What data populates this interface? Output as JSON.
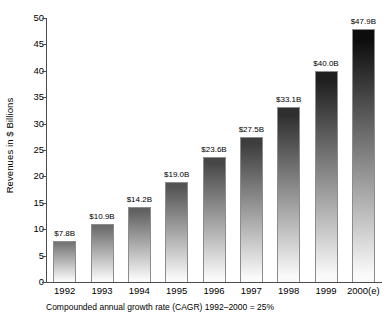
{
  "chart_data": {
    "type": "bar",
    "title": "",
    "xlabel": "",
    "ylabel": "Revenues in $ Billions",
    "categories": [
      "1992",
      "1993",
      "1994",
      "1995",
      "1996",
      "1997",
      "1998",
      "1999",
      "2000(e)"
    ],
    "values": [
      7.8,
      10.9,
      14.2,
      19.0,
      23.6,
      27.5,
      33.1,
      40.0,
      47.9
    ],
    "data_labels": [
      "$7.8B",
      "$10.9B",
      "$14.2B",
      "$19.0B",
      "$23.6B",
      "$27.5B",
      "$33.1B",
      "$40.0B",
      "$47.9B"
    ],
    "ylim": [
      0,
      50
    ],
    "yticks": [
      0,
      5,
      10,
      15,
      20,
      25,
      30,
      35,
      40,
      45,
      50
    ],
    "ytick_labels": [
      "0",
      "5",
      "10",
      "15",
      "20",
      "25",
      "30",
      "35",
      "40",
      "45",
      "50"
    ],
    "grid": false,
    "legend": "none",
    "annotation": "Compounded annual growth rate (CAGR) 1992–2000 = 25%",
    "bar_style": "vertical-gradient-dark-top-to-white-bottom",
    "colors": {
      "axis": "#4c4c4c",
      "bar_outline": "#8c8c8c",
      "bar_top_min": "#9a9a9a",
      "bar_top_max": "#0d0d0d",
      "bar_bottom": "#fafafa",
      "text": "#000000",
      "background": "#ffffff"
    }
  }
}
